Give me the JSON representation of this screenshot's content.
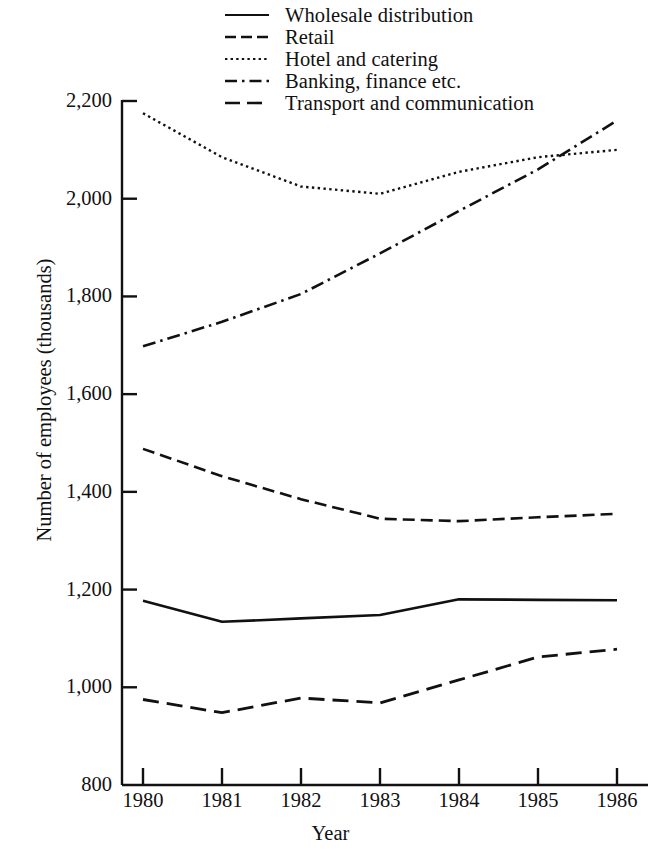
{
  "chart_data": {
    "type": "line",
    "title": "",
    "xlabel": "Year",
    "ylabel": "Number of employees (thousands)",
    "x": [
      1980,
      1981,
      1982,
      1983,
      1984,
      1985,
      1986
    ],
    "xticklabels": [
      "1980",
      "1981",
      "1982",
      "1983",
      "1984",
      "1985",
      "1986"
    ],
    "yticklabels": [
      "2,200",
      "2,000",
      "1,800",
      "1,600",
      "1,400",
      "1,200",
      "1,000",
      "800"
    ],
    "ytickvalues": [
      2200,
      2000,
      1800,
      1600,
      1400,
      1200,
      1000,
      800
    ],
    "ylim": [
      800,
      2200
    ],
    "xlim": [
      1980,
      1986
    ],
    "grid": false,
    "legend_position": "top-center",
    "series": [
      {
        "name": "Wholesale distribution",
        "style": "solid",
        "values": [
          1177,
          1134,
          1141,
          1148,
          1180,
          1179,
          1178
        ]
      },
      {
        "name": "Retail",
        "style": "dashed",
        "values": [
          1488,
          1432,
          1385,
          1345,
          1340,
          1348,
          1355
        ]
      },
      {
        "name": "Hotel and catering",
        "style": "dotted",
        "values": [
          2175,
          2085,
          2025,
          2010,
          2055,
          2085,
          2100
        ]
      },
      {
        "name": "Banking, finance etc.",
        "style": "dash-dot",
        "values": [
          1698,
          1748,
          1805,
          1888,
          1975,
          2060,
          2160
        ]
      },
      {
        "name": "Transport and communication",
        "style": "dash-long",
        "values": [
          975,
          948,
          978,
          968,
          1015,
          1062,
          1078
        ]
      }
    ]
  },
  "legend": {
    "items": [
      {
        "label": "Wholesale distribution",
        "key": "solid-line-key"
      },
      {
        "label": "Retail",
        "key": "dashed-line-key"
      },
      {
        "label": "Hotel and catering",
        "key": "dotted-line-key"
      },
      {
        "label": "Banking, finance etc.",
        "key": "dash-dot-line-key"
      },
      {
        "label": "Transport and communication",
        "key": "long-dash-line-key"
      }
    ]
  },
  "axes": {
    "y_title": "Number of employees (thousands)",
    "x_title": "Year",
    "y_ticks": [
      "2,200",
      "2,000",
      "1,800",
      "1,600",
      "1,400",
      "1,200",
      "1,000",
      "800"
    ],
    "x_ticks": [
      "1980",
      "1981",
      "1982",
      "1983",
      "1984",
      "1985",
      "1986"
    ]
  },
  "colors": {
    "ink": "#111111",
    "background": "#ffffff"
  }
}
